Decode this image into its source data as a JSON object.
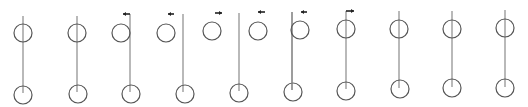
{
  "diagram": {
    "title": "",
    "stroke_color": "#555555",
    "line_color": "#8a8a8a",
    "arrow_color": "#222222",
    "figure_count": 11,
    "figures": [
      {
        "id": 1,
        "line_x": 23,
        "line_top": 16,
        "line_bottom": 93,
        "top_circle": {
          "cx": 23,
          "cy": 33,
          "r": 9
        },
        "bottom_circle": {
          "cx": 23,
          "cy": 95,
          "r": 9
        },
        "marker": null
      },
      {
        "id": 2,
        "line_x": 77,
        "line_top": 16,
        "line_bottom": 92,
        "top_circle": {
          "cx": 77,
          "cy": 33,
          "r": 9
        },
        "bottom_circle": {
          "cx": 78,
          "cy": 94,
          "r": 9
        },
        "marker": null
      },
      {
        "id": 3,
        "line_x": 130,
        "line_top": 14,
        "line_bottom": 92,
        "top_circle": {
          "cx": 121,
          "cy": 33,
          "r": 9
        },
        "bottom_circle": {
          "cx": 131,
          "cy": 94,
          "r": 9
        },
        "marker": {
          "type": "flag-left",
          "x1": 130,
          "x2": 123,
          "y": 14
        }
      },
      {
        "id": 4,
        "line_x": 183,
        "line_top": 14,
        "line_bottom": 92,
        "top_circle": {
          "cx": 166,
          "cy": 33,
          "r": 9
        },
        "bottom_circle": {
          "cx": 185,
          "cy": 94,
          "r": 9
        },
        "marker": {
          "type": "arrow-left",
          "x1": 174,
          "x2": 168,
          "y": 14
        }
      },
      {
        "id": 5,
        "line_x": 239,
        "line_top": 13,
        "line_bottom": 91,
        "top_circle": {
          "cx": 212,
          "cy": 31,
          "r": 9
        },
        "bottom_circle": {
          "cx": 239,
          "cy": 93,
          "r": 9
        },
        "marker": {
          "type": "arrow-right",
          "x1": 215,
          "x2": 222,
          "y": 13
        }
      },
      {
        "id": 6,
        "line_x": 292,
        "line_top": 12,
        "line_bottom": 90,
        "top_circle": {
          "cx": 258,
          "cy": 31,
          "r": 9
        },
        "bottom_circle": {
          "cx": 293,
          "cy": 92,
          "r": 9
        },
        "marker": {
          "type": "arrow-left",
          "x1": 265,
          "x2": 258,
          "y": 12
        }
      },
      {
        "id": 7,
        "line_x": 292,
        "line_top": 12,
        "line_bottom": 90,
        "top_circle": {
          "cx": 300,
          "cy": 30,
          "r": 9
        },
        "bottom_circle": null,
        "marker": {
          "type": "arrow-left",
          "x1": 307,
          "x2": 301,
          "y": 12
        }
      },
      {
        "id": 8,
        "line_x": 346,
        "line_top": 11,
        "line_bottom": 89,
        "top_circle": {
          "cx": 346,
          "cy": 29,
          "r": 9
        },
        "bottom_circle": {
          "cx": 346,
          "cy": 91,
          "r": 9
        },
        "marker": {
          "type": "flag-right",
          "x1": 346,
          "x2": 354,
          "y": 11
        }
      },
      {
        "id": 9,
        "line_x": 399,
        "line_top": 11,
        "line_bottom": 88,
        "top_circle": {
          "cx": 399,
          "cy": 29,
          "r": 9
        },
        "bottom_circle": {
          "cx": 400,
          "cy": 89,
          "r": 9
        },
        "marker": null
      },
      {
        "id": 10,
        "line_x": 452,
        "line_top": 11,
        "line_bottom": 87,
        "top_circle": {
          "cx": 452,
          "cy": 29,
          "r": 9
        },
        "bottom_circle": {
          "cx": 452,
          "cy": 88,
          "r": 9
        },
        "marker": null
      },
      {
        "id": 11,
        "line_x": 505,
        "line_top": 10,
        "line_bottom": 87,
        "top_circle": {
          "cx": 505,
          "cy": 28,
          "r": 9
        },
        "bottom_circle": {
          "cx": 505,
          "cy": 88,
          "r": 9
        },
        "marker": null
      }
    ]
  }
}
